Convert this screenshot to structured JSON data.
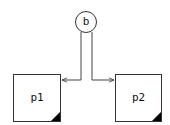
{
  "diagram": {
    "nodes": [
      {
        "id": "b",
        "label": "b",
        "shape": "circle"
      },
      {
        "id": "p1",
        "label": "p1",
        "shape": "box"
      },
      {
        "id": "p2",
        "label": "p2",
        "shape": "box"
      }
    ],
    "edges": [
      {
        "from": "b",
        "to": "p1"
      },
      {
        "from": "b",
        "to": "p2"
      }
    ],
    "colors": {
      "stroke": "#333333",
      "fill": "#ffffff",
      "corner": "#000000"
    }
  }
}
